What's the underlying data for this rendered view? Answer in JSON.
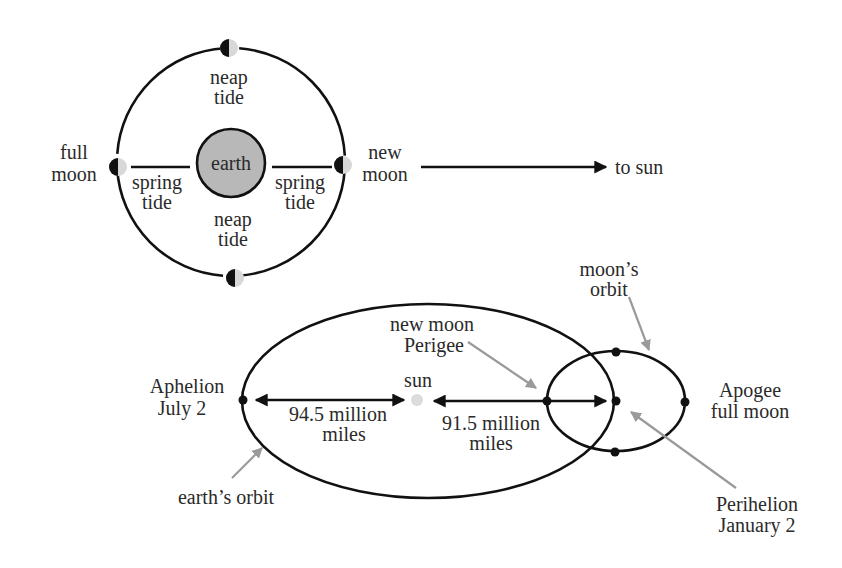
{
  "colors": {
    "line": "#111111",
    "earth_fill": "#b8b8b8",
    "moon_light": "#d8d8d8",
    "sun_fill": "#dcdcdc",
    "pointer": "#9a9a9a",
    "text": "#2a2a2a"
  },
  "top_diagram": {
    "earth_label": "earth",
    "neap_top": [
      "neap",
      "tide"
    ],
    "neap_bottom": [
      "neap",
      "tide"
    ],
    "spring_left": [
      "spring",
      "tide"
    ],
    "spring_right": [
      "spring",
      "tide"
    ],
    "full_moon": [
      "full",
      "moon"
    ],
    "new_moon": [
      "new",
      "moon"
    ],
    "to_sun": "to sun"
  },
  "bottom_diagram": {
    "aphelion": [
      "Aphelion",
      "July 2"
    ],
    "sun_label": "sun",
    "left_distance": [
      "94.5 million",
      "miles"
    ],
    "right_distance": [
      "91.5 million",
      "miles"
    ],
    "new_moon_perigee": [
      "new moon",
      "Perigee"
    ],
    "moons_orbit": [
      "moon’s",
      "orbit"
    ],
    "apogee": [
      "Apogee",
      "full moon"
    ],
    "perihelion": [
      "Perihelion",
      "January 2"
    ],
    "earths_orbit": "earth’s orbit"
  }
}
